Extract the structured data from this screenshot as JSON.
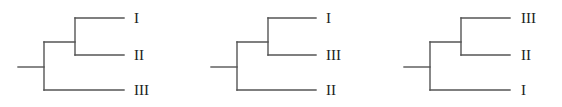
{
  "figure": {
    "line_color": "#555555",
    "text_color": "#222222",
    "trees": [
      {
        "name": "tree-1",
        "grouping": "((I, II), III)",
        "leaves": [
          {
            "label": "I"
          },
          {
            "label": "II"
          },
          {
            "label": "III"
          }
        ]
      },
      {
        "name": "tree-2",
        "grouping": "((I, III), II)",
        "leaves": [
          {
            "label": "I"
          },
          {
            "label": "III"
          },
          {
            "label": "II"
          }
        ]
      },
      {
        "name": "tree-3",
        "grouping": "((III, II), I)",
        "leaves": [
          {
            "label": "III"
          },
          {
            "label": "II"
          },
          {
            "label": "I"
          }
        ]
      }
    ]
  }
}
